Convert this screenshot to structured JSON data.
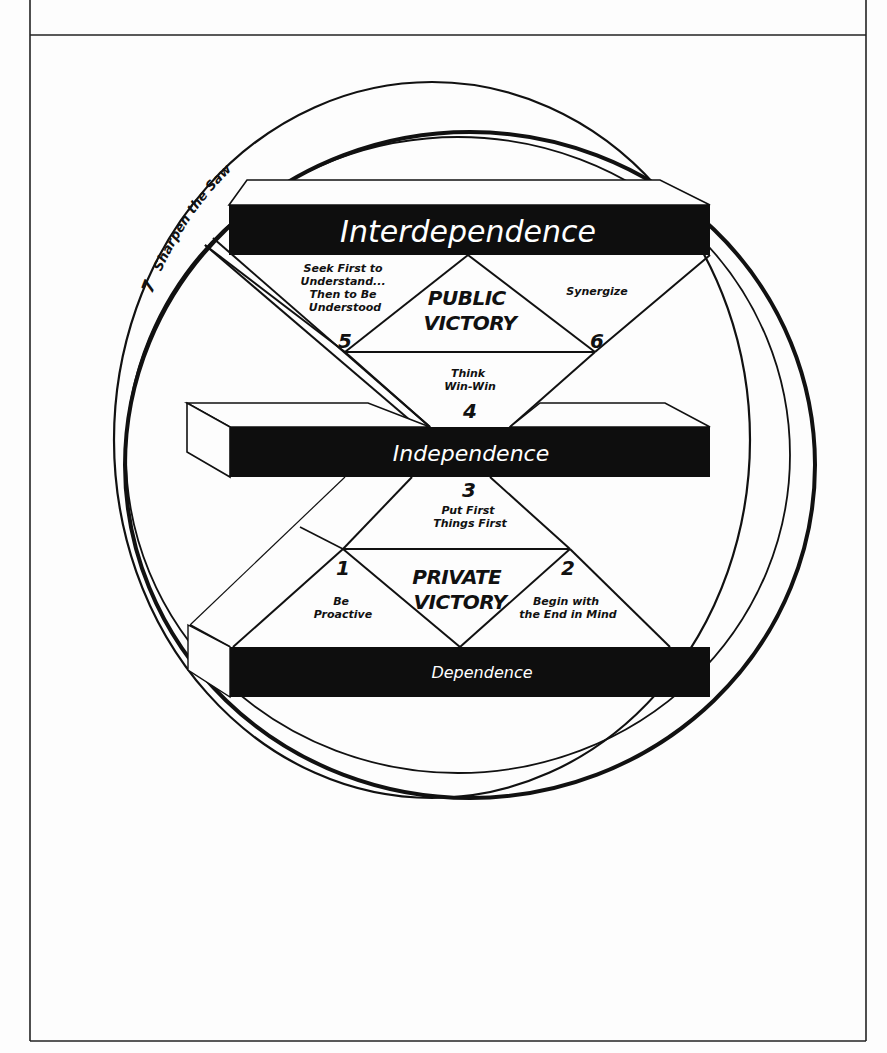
{
  "diagram": {
    "title": "",
    "colors": {
      "ink": "#111111",
      "paper": "#fdfdfd",
      "bar": "#0e0e0e",
      "bar_text": "#ffffff"
    },
    "outer_ring": {
      "number": "7",
      "label": "Sharpen the Saw"
    },
    "levels": {
      "interdependence": "Interdependence",
      "independence": "Independence",
      "dependence": "Dependence"
    },
    "victories": {
      "public_line1": "PUBLIC",
      "public_line2": "VICTORY",
      "private_line1": "PRIVATE",
      "private_line2": "VICTORY"
    },
    "habits": [
      {
        "number": "1",
        "lines": [
          "Be",
          "Proactive"
        ]
      },
      {
        "number": "2",
        "lines": [
          "Begin with",
          "the End in Mind"
        ]
      },
      {
        "number": "3",
        "lines": [
          "Put First",
          "Things First"
        ]
      },
      {
        "number": "4",
        "lines": [
          "Think",
          "Win-Win"
        ]
      },
      {
        "number": "5",
        "lines": [
          "Seek First to",
          "Understand...",
          "Then to Be",
          "Understood"
        ]
      },
      {
        "number": "6",
        "lines": [
          "Synergize"
        ]
      }
    ]
  }
}
